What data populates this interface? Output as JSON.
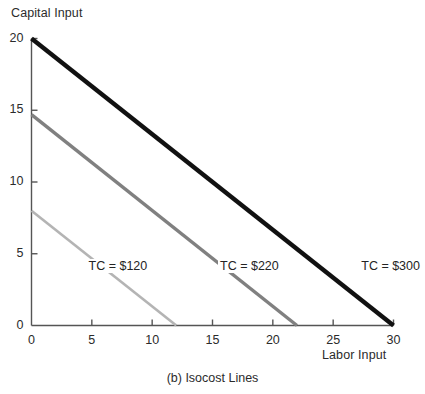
{
  "caption": "(b) Isocost Lines",
  "chart_data": {
    "type": "line",
    "title": "",
    "xlabel": "Labor Input",
    "ylabel": "Capital Input",
    "xlim": [
      0,
      30
    ],
    "ylim": [
      0,
      20
    ],
    "xticks": [
      0,
      5,
      10,
      15,
      20,
      25,
      30
    ],
    "yticks": [
      0,
      5,
      10,
      15,
      20
    ],
    "xtick_labels": [
      "0",
      "5",
      "10",
      "15",
      "20",
      "25",
      "30"
    ],
    "ytick_labels": [
      "0",
      "5",
      "10",
      "15",
      "20"
    ],
    "grid": false,
    "legend_position": "inline-annotations",
    "series": [
      {
        "name": "TC = $120",
        "label": "TC = $120",
        "color": "#b4b4b4",
        "width": 2.6,
        "x": [
          0,
          12
        ],
        "y": [
          8,
          0
        ],
        "label_x": 9.7,
        "label_y": 4.1
      },
      {
        "name": "TC = $220",
        "label": "TC = $220",
        "color": "#808080",
        "width": 3.4,
        "x": [
          0,
          22
        ],
        "y": [
          14.7,
          0
        ],
        "label_x": 20.6,
        "label_y": 4.1
      },
      {
        "name": "TC = $300",
        "label": "TC = $300",
        "color": "#111111",
        "width": 4.4,
        "x": [
          0,
          30
        ],
        "y": [
          20,
          0
        ],
        "label_x": 32.3,
        "label_y": 4.1
      }
    ],
    "annotations": [
      {
        "text": "TC = $120"
      },
      {
        "text": "TC = $220"
      },
      {
        "text": "TC = $300"
      }
    ]
  },
  "axis": {
    "color": "#555555",
    "tick_length": 6
  }
}
